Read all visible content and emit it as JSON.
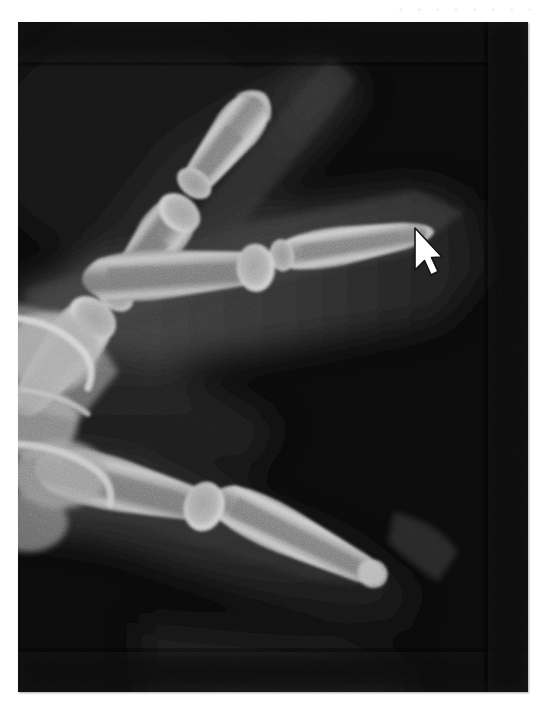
{
  "page": {
    "background_color": "#ffffff",
    "width": 551,
    "height": 706,
    "watermark_text": "· · · · · · · ·"
  },
  "radiograph": {
    "name": "hand-xray",
    "modality": "X-ray",
    "body_part": "hand / fingers",
    "view": "oblique",
    "frame": {
      "x": 18,
      "y": 22,
      "width": 510,
      "height": 670
    },
    "colors": {
      "film_background": "#0b0b0b",
      "soft_tissue_dark": "#1c1c1c",
      "soft_tissue_mid": "#303030",
      "soft_tissue_light": "#4a4a4a",
      "bone_shaft": "#8d8d8d",
      "bone_cortex": "#c6c6c6",
      "bone_bright": "#d8d8d8"
    },
    "structures": [
      {
        "label": "index finger distal phalanx",
        "region": "upper-left"
      },
      {
        "label": "index finger middle phalanx",
        "region": "upper-left"
      },
      {
        "label": "index finger proximal phalanx",
        "region": "mid-left"
      },
      {
        "label": "middle finger distal phalanx",
        "region": "center-right"
      },
      {
        "label": "middle finger interphalangeal joint",
        "region": "center"
      },
      {
        "label": "ring finger proximal phalanx",
        "region": "lower-center"
      },
      {
        "label": "ring finger middle phalanx",
        "region": "lower-right"
      },
      {
        "label": "metacarpal heads",
        "region": "left"
      }
    ]
  },
  "cursor": {
    "name": "mouse-pointer",
    "type": "arrow",
    "fill_color": "#ffffff",
    "stroke_color": "#111111",
    "tip_x": 415,
    "tip_y": 229
  }
}
